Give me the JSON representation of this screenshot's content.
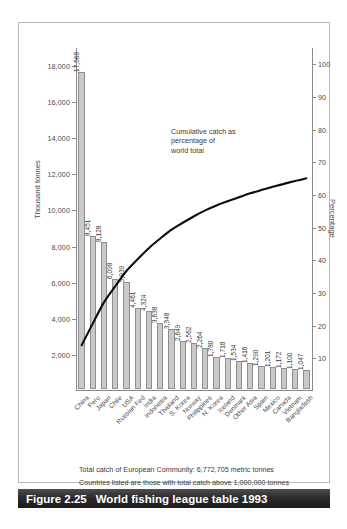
{
  "figure": {
    "caption_number": "Figure 2.25",
    "caption_text": "World fishing league table 1993",
    "footnote_1": "Total catch of European Community: 6,772,705 metric tonnes",
    "footnote_2": "Countries listed are those with total catch above 1,000,000 tonnes",
    "annotation": "Cumulative catch as\npercentage of\nworld total"
  },
  "chart_data": {
    "type": "bar",
    "title": "World fishing league table 1993",
    "xlabel": "",
    "ylabel": "Thousand tonnes",
    "y2label": "Percentage",
    "ylim": [
      0,
      19000
    ],
    "y2lim": [
      0,
      105
    ],
    "yticks": [
      2000,
      4000,
      6000,
      8000,
      10000,
      12000,
      14000,
      16000,
      18000
    ],
    "ytick_labels": [
      "2,000",
      "4,000",
      "6,000",
      "8,000",
      "10,000",
      "12,000",
      "14,000",
      "16,000",
      "18,000"
    ],
    "y2ticks": [
      10,
      20,
      30,
      40,
      50,
      60,
      70,
      80,
      90,
      100
    ],
    "y2tick_labels": [
      "10",
      "20",
      "30",
      "40",
      "50",
      "60",
      "70",
      "80",
      "90",
      "100"
    ],
    "grid": false,
    "legend": "none",
    "annotations": [
      "Cumulative catch as percentage of world total"
    ],
    "categories": [
      "China",
      "Peru",
      "Japan",
      "Chile",
      "USA",
      "Russian Fed",
      "India",
      "Indonesia",
      "Thailand",
      "S. Korea",
      "Norway",
      "Philippines",
      "N. Korea",
      "Iceland",
      "Denmark",
      "Other Asia",
      "Spain",
      "Mexico",
      "Canada",
      "Vietnam",
      "Bangladesh"
    ],
    "values": [
      17568,
      8451,
      8128,
      6098,
      5939,
      4461,
      4324,
      3638,
      3348,
      2649,
      2562,
      2264,
      1780,
      1718,
      1534,
      1416,
      1290,
      1201,
      1172,
      1100,
      1047
    ],
    "value_labels": [
      "17,568",
      "8,451",
      "8,128",
      "6,098",
      "5,939",
      "4,461",
      "4,324",
      "3,638",
      "3,348",
      "2,649",
      "2,562",
      "2,264",
      "1,780",
      "1,718",
      "1,534",
      "1,416",
      "1,290",
      "1,201",
      "1,172",
      "1,100",
      "1,047"
    ],
    "cumulative_series": {
      "name": "Cumulative catch as percentage of world total",
      "unit": "percent",
      "values": [
        14.0,
        20.7,
        27.2,
        32.1,
        36.8,
        40.4,
        43.8,
        46.7,
        49.4,
        51.5,
        53.5,
        55.3,
        56.8,
        58.1,
        59.3,
        60.5,
        61.5,
        62.5,
        63.4,
        64.3,
        65.1
      ]
    }
  }
}
